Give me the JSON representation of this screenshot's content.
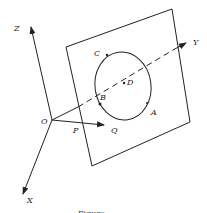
{
  "diagram": {
    "type": "3d-geometry",
    "axes": {
      "x_label": "X",
      "y_label": "Y",
      "z_label": "Z",
      "origin_label": "O"
    },
    "points": {
      "A": "A",
      "B": "B",
      "C": "C",
      "D": "D",
      "P": "P",
      "Q": "Q"
    },
    "elements": [
      "plane",
      "circle on plane",
      "dashed Y axis through plane",
      "vector O to Q through P"
    ],
    "caption": "Figure"
  },
  "colors": {
    "line": "#222222",
    "background": "#ffffff"
  }
}
